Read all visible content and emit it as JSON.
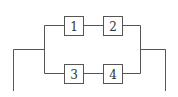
{
  "diagram": {
    "type": "series-parallel circuit",
    "blocks": [
      {
        "id": "1",
        "label": "1",
        "branch": "top"
      },
      {
        "id": "2",
        "label": "2",
        "branch": "top"
      },
      {
        "id": "3",
        "label": "3",
        "branch": "bottom"
      },
      {
        "id": "4",
        "label": "4",
        "branch": "bottom"
      }
    ],
    "line_color": "#555555"
  }
}
